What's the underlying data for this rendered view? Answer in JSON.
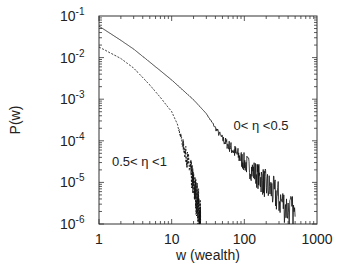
{
  "chart_data": {
    "type": "line",
    "title": "",
    "xlabel": "w (wealth)",
    "ylabel": "P(w)",
    "xscale": "log",
    "yscale": "log",
    "xlim": [
      1,
      1000
    ],
    "ylim": [
      1e-06,
      0.1
    ],
    "grid": false,
    "legend": "none",
    "xticks": [
      {
        "value": 1,
        "label": "1"
      },
      {
        "value": 10,
        "label": "10"
      },
      {
        "value": 100,
        "label": "100"
      },
      {
        "value": 1000,
        "label": "1000"
      }
    ],
    "yticks": [
      {
        "value": 0.1,
        "base": "10",
        "exp": "-1"
      },
      {
        "value": 0.01,
        "base": "10",
        "exp": "-2"
      },
      {
        "value": 0.001,
        "base": "10",
        "exp": "-3"
      },
      {
        "value": 0.0001,
        "base": "10",
        "exp": "-4"
      },
      {
        "value": 1e-05,
        "base": "10",
        "exp": "-5"
      },
      {
        "value": 1e-06,
        "base": "10",
        "exp": "-6"
      }
    ],
    "series": [
      {
        "name": "0< η <0.5",
        "style": "solid",
        "x": [
          1,
          2,
          3,
          5,
          10,
          20,
          30,
          50,
          70,
          100,
          150,
          200,
          300,
          500
        ],
        "y": [
          0.057,
          0.026,
          0.016,
          0.0078,
          0.0029,
          0.00097,
          0.00045,
          0.00011,
          6e-05,
          3e-05,
          1.5e-05,
          8.7e-06,
          4e-06,
          1.5e-06
        ]
      },
      {
        "name": "0.5< η <1",
        "style": "dashed",
        "x": [
          1,
          2,
          3,
          5,
          7,
          10,
          12,
          15,
          18,
          20,
          23,
          25
        ],
        "y": [
          0.018,
          0.0095,
          0.0056,
          0.0022,
          0.0011,
          0.0005,
          0.00025,
          6e-05,
          2e-05,
          8.7e-06,
          3e-06,
          1.2e-06
        ]
      }
    ],
    "annotations": [
      {
        "text": "0< η <0.5",
        "x": 170,
        "y": 0.00018
      },
      {
        "text": "0.5< η <1",
        "x": 3.6,
        "y": 2.5e-05
      }
    ]
  }
}
